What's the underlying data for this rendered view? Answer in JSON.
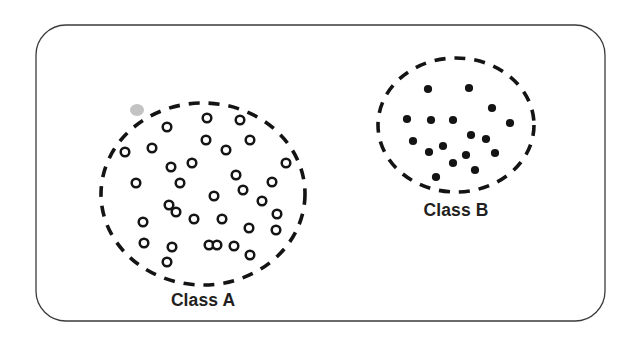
{
  "figure": {
    "title": "",
    "type": "scatter-cluster-diagram",
    "background_color": "#ffffff",
    "ink_color": "#1a1a1a",
    "frame": {
      "name": "outer-rounded-rectangle",
      "x": 36,
      "y": 25,
      "width": 569,
      "height": 296,
      "radius": 30,
      "stroke": "#3b3b3b",
      "stroke_width": 1.3,
      "fill": "none"
    },
    "clusters": [
      {
        "id": "class-a",
        "label": "Class A",
        "label_x": 203,
        "label_y": 306,
        "marker_style": "open-circle",
        "marker_fill": "#ffffff",
        "marker_stroke": "#151515",
        "marker_radius": 4.3,
        "marker_stroke_width": 2.5,
        "point_count": 33,
        "boundary": {
          "shape": "dashed-ellipse",
          "cx": 203,
          "cy": 194,
          "rx": 102,
          "ry": 91,
          "stroke": "#141414",
          "stroke_width": 3.6,
          "dash": "11 9"
        },
        "points": [
          [
            167,
            127
          ],
          [
            207,
            118
          ],
          [
            240,
            120
          ],
          [
            125,
            152
          ],
          [
            152,
            148
          ],
          [
            192,
            163
          ],
          [
            226,
            150
          ],
          [
            250,
            140
          ],
          [
            171,
            167
          ],
          [
            236,
            175
          ],
          [
            136,
            183
          ],
          [
            180,
            183
          ],
          [
            243,
            190
          ],
          [
            272,
            182
          ],
          [
            169,
            205
          ],
          [
            176,
            212
          ],
          [
            143,
            222
          ],
          [
            194,
            219
          ],
          [
            222,
            219
          ],
          [
            249,
            228
          ],
          [
            277,
            214
          ],
          [
            276,
            230
          ],
          [
            144,
            243
          ],
          [
            172,
            247
          ],
          [
            209,
            245
          ],
          [
            217,
            245
          ],
          [
            234,
            246
          ],
          [
            250,
            255
          ],
          [
            167,
            262
          ],
          [
            206,
            140
          ],
          [
            286,
            163
          ],
          [
            262,
            201
          ],
          [
            214,
            196
          ]
        ]
      },
      {
        "id": "class-b",
        "label": "Class B",
        "label_x": 456,
        "label_y": 216,
        "marker_style": "filled-circle",
        "marker_fill": "#141414",
        "marker_stroke": "#141414",
        "marker_radius": 4.1,
        "marker_stroke_width": 0,
        "point_count": 17,
        "boundary": {
          "shape": "dashed-ellipse",
          "cx": 456,
          "cy": 125,
          "rx": 78,
          "ry": 67,
          "stroke": "#141414",
          "stroke_width": 3.6,
          "dash": "11 9"
        },
        "points": [
          [
            428,
            89
          ],
          [
            469,
            88
          ],
          [
            431,
            120
          ],
          [
            453,
            120
          ],
          [
            492,
            108
          ],
          [
            407,
            119
          ],
          [
            510,
            123
          ],
          [
            471,
            135
          ],
          [
            413,
            141
          ],
          [
            443,
            146
          ],
          [
            486,
            139
          ],
          [
            429,
            152
          ],
          [
            466,
            155
          ],
          [
            495,
            153
          ],
          [
            453,
            163
          ],
          [
            436,
            177
          ],
          [
            475,
            170
          ]
        ]
      }
    ],
    "artifacts": [
      {
        "name": "scan-smudge",
        "x": 137,
        "y": 110,
        "rx": 7,
        "ry": 6,
        "color": "#b9b9b9",
        "opacity": 0.85
      }
    ]
  },
  "chart_data": {
    "type": "scatter",
    "title": "",
    "xlabel": "",
    "ylabel": "",
    "legend_position": "below-cluster",
    "grid": false,
    "series": [
      {
        "name": "Class A",
        "marker": "open-circle",
        "count": 33
      },
      {
        "name": "Class B",
        "marker": "filled-circle",
        "count": 17
      }
    ]
  }
}
